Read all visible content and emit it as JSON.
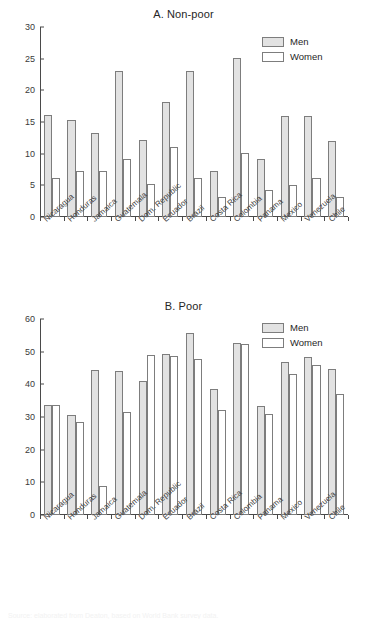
{
  "figure": {
    "caption_fragment": "Source: elaborated from Deaton, based on World Bank survey data."
  },
  "legend": {
    "men_label": "Men",
    "women_label": "Women",
    "men_color": "#e2e2e2",
    "women_color": "#ffffff",
    "outline_color": "#7d7d7d"
  },
  "chart_data": [
    {
      "type": "bar",
      "title": "A. Non-poor",
      "xlabel": "",
      "ylabel": "",
      "ylim": [
        0,
        30
      ],
      "yticks": [
        0,
        5,
        10,
        15,
        20,
        25,
        30
      ],
      "grid": false,
      "legend_position": "top-right",
      "categories": [
        "Nicaragua",
        "Honduras",
        "Jamaica",
        "Guatemala",
        "Dom. Republic",
        "Ecuador",
        "Brazil",
        "Costa Rica",
        "Colombia",
        "Panama",
        "Mexico",
        "Venezuela",
        "Chile"
      ],
      "series": [
        {
          "name": "Men",
          "values": [
            16.1,
            15.3,
            13.2,
            23.1,
            12.1,
            18.2,
            23.1,
            7.2,
            25.1,
            9.1,
            16.0,
            16.0,
            12.0
          ]
        },
        {
          "name": "Women",
          "values": [
            6.2,
            7.2,
            7.2,
            9.2,
            5.2,
            11.1,
            6.1,
            3.1,
            10.1,
            4.2,
            5.1,
            6.1,
            3.1
          ]
        }
      ]
    },
    {
      "type": "bar",
      "title": "B. Poor",
      "xlabel": "",
      "ylabel": "",
      "ylim": [
        0,
        60
      ],
      "yticks": [
        0,
        10,
        20,
        30,
        40,
        50,
        60
      ],
      "grid": false,
      "legend_position": "top-right",
      "categories": [
        "Nicaragua",
        "Honduras",
        "Jamaica",
        "Guatemala",
        "Dom. Republic",
        "Ecuador",
        "Brazil",
        "Costa Rica",
        "Colombia",
        "Panama",
        "Mexico",
        "Venezuela",
        "Chile"
      ],
      "series": [
        {
          "name": "Men",
          "values": [
            33.8,
            30.6,
            44.5,
            44.1,
            41.0,
            49.2,
            55.6,
            38.7,
            52.7,
            33.5,
            46.7,
            48.4,
            44.6
          ]
        },
        {
          "name": "Women",
          "values": [
            33.8,
            28.4,
            8.8,
            31.6,
            49.1,
            48.8,
            47.9,
            32.2,
            52.3,
            31.0,
            43.1,
            46.0,
            37.1
          ]
        }
      ]
    }
  ]
}
